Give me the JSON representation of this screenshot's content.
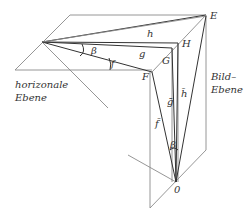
{
  "diagram": {
    "labels": {
      "E": "E",
      "H": "H",
      "G": "G",
      "F": "F",
      "O": "0",
      "h": "h",
      "g": "g",
      "f": "f",
      "beta_top": "β",
      "beta_bottom": "β",
      "h_bar": "h̄",
      "g_bar": "ḡ",
      "f_bar": "f̄",
      "plane_horizontal_line1": "horizonale",
      "plane_horizontal_line2": "Ebene",
      "plane_picture_line1": "Bild–",
      "plane_picture_line2": "Ebene"
    },
    "colors": {
      "line": "#8a8a8a",
      "line_dark": "#333333",
      "text": "#333333",
      "background": "#ffffff"
    }
  }
}
